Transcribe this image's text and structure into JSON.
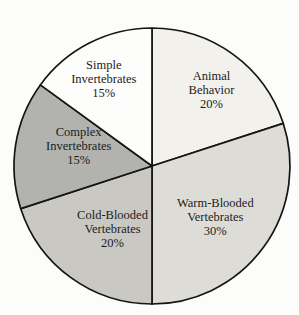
{
  "page": {
    "background": "#fcfcfb"
  },
  "chart_data": {
    "type": "pie",
    "title": "",
    "direction": "clockwise",
    "start_angle_deg": 0,
    "center": {
      "x": 152,
      "y": 166
    },
    "radius": 138,
    "stroke_color": "#151515",
    "stroke_width": 1.7,
    "text_color": "#1c1c1c",
    "font_size": 12.5,
    "line_height": 14,
    "legend": "none",
    "segments": [
      {
        "label": "Animal Behavior",
        "label_lines": [
          "Animal",
          "Behavior",
          "20%"
        ],
        "value_pct": 20,
        "color": "#f2f1eb",
        "label_angle_deg": 38,
        "label_radius_frac": 0.7
      },
      {
        "label": "Warm-Blooded Vertebrates",
        "label_lines": [
          "Warm-Blooded",
          "Vertebrates",
          "30%"
        ],
        "value_pct": 30,
        "color": "#dedcd6",
        "label_angle_deg": 129,
        "label_radius_frac": 0.59
      },
      {
        "label": "Cold-Blooded Vertebrates",
        "label_lines": [
          "Cold-Blooded",
          "Vertebrates",
          "20%"
        ],
        "value_pct": 20,
        "color": "#c9c8c2",
        "label_angle_deg": 212,
        "label_radius_frac": 0.54
      },
      {
        "label": "Complex Invertebrates",
        "label_lines": [
          "Complex",
          "Invertebrates",
          "15%"
        ],
        "value_pct": 15,
        "color": "#b2b2ae",
        "label_angle_deg": 285,
        "label_radius_frac": 0.55
      },
      {
        "label": "Simple Invertebrates",
        "label_lines": [
          "Simple",
          "Invertebrates",
          "15%"
        ],
        "value_pct": 15,
        "color": "#fdfdfb",
        "label_angle_deg": 331,
        "label_radius_frac": 0.72
      }
    ]
  }
}
